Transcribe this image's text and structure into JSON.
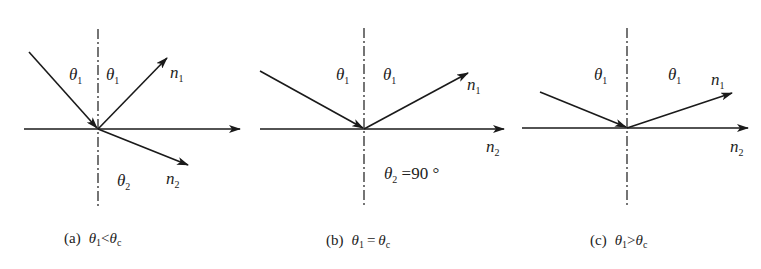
{
  "figure": {
    "panels": [
      {
        "id": "a",
        "caption": {
          "prefix": "(a)",
          "lhs": "θ",
          "lhs_sub": "1",
          "op": "<",
          "rhs": "θ",
          "rhs_sub": "c"
        },
        "labels": {
          "incident_angle": {
            "sym": "θ",
            "sub": "1"
          },
          "reflected_angle": {
            "sym": "θ",
            "sub": "1"
          },
          "medium_top": {
            "sym": "n",
            "sub": "1"
          },
          "refracted_angle": {
            "sym": "θ",
            "sub": "2"
          },
          "medium_bottom": {
            "sym": "n",
            "sub": "2"
          }
        }
      },
      {
        "id": "b",
        "caption": {
          "prefix": "(b)",
          "lhs": "θ",
          "lhs_sub": "1",
          "op": "=",
          "rhs": "θ",
          "rhs_sub": "c"
        },
        "labels": {
          "incident_angle": {
            "sym": "θ",
            "sub": "1"
          },
          "reflected_angle": {
            "sym": "θ",
            "sub": "1"
          },
          "medium_top": {
            "sym": "n",
            "sub": "1"
          },
          "medium_bottom": {
            "sym": "n",
            "sub": "2"
          },
          "refracted_angle": {
            "sym": "θ",
            "sub": "2",
            "value": " =90 °"
          }
        }
      },
      {
        "id": "c",
        "caption": {
          "prefix": "(c)",
          "lhs": "θ",
          "lhs_sub": "1",
          "op": ">",
          "rhs": "θ",
          "rhs_sub": "c"
        },
        "labels": {
          "incident_angle": {
            "sym": "θ",
            "sub": "1"
          },
          "reflected_angle": {
            "sym": "θ",
            "sub": "1"
          },
          "medium_top": {
            "sym": "n",
            "sub": "1"
          },
          "medium_bottom": {
            "sym": "n",
            "sub": "2"
          }
        }
      }
    ],
    "colors": {
      "stroke": "#1a1a1a",
      "text": "#222222",
      "background": "#ffffff"
    }
  }
}
